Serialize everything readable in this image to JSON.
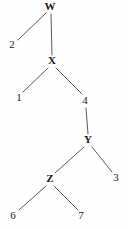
{
  "diagram": {
    "type": "tree",
    "title": "",
    "background_color": "#fefefe",
    "edge_color": "#5a5a5a",
    "text_color": "#1a1a1a",
    "width": 128,
    "height": 229,
    "nodes": [
      {
        "id": "W",
        "label": "W",
        "x": 50,
        "y": 7
      },
      {
        "id": "X",
        "label": "X",
        "x": 52,
        "y": 61
      },
      {
        "id": "Y",
        "label": "Y",
        "x": 88,
        "y": 140
      },
      {
        "id": "Z",
        "label": "Z",
        "x": 50,
        "y": 179
      }
    ],
    "leaves": [
      {
        "id": "L2",
        "label": "2",
        "x": 12,
        "y": 45
      },
      {
        "id": "L1",
        "label": "1",
        "x": 19,
        "y": 98
      },
      {
        "id": "L4",
        "label": "4",
        "x": 85,
        "y": 101
      },
      {
        "id": "L3",
        "label": "3",
        "x": 116,
        "y": 178
      },
      {
        "id": "L6",
        "label": "6",
        "x": 13,
        "y": 216
      },
      {
        "id": "L7",
        "label": "7",
        "x": 81,
        "y": 216
      }
    ],
    "edges": [
      {
        "from": "W",
        "to": "L2",
        "x1": 46,
        "y1": 13,
        "x2": 18,
        "y2": 40
      },
      {
        "from": "W",
        "to": "X",
        "x1": 51,
        "y1": 14,
        "x2": 52,
        "y2": 55
      },
      {
        "from": "X",
        "to": "L1",
        "x1": 48,
        "y1": 68,
        "x2": 23,
        "y2": 92
      },
      {
        "from": "X",
        "to": "L4",
        "x1": 56,
        "y1": 68,
        "x2": 82,
        "y2": 94
      },
      {
        "from": "L4",
        "to": "Y",
        "x1": 86,
        "y1": 108,
        "x2": 88,
        "y2": 134
      },
      {
        "from": "Y",
        "to": "Z",
        "x1": 84,
        "y1": 147,
        "x2": 55,
        "y2": 173
      },
      {
        "from": "Y",
        "to": "L3",
        "x1": 92,
        "y1": 147,
        "x2": 112,
        "y2": 172
      },
      {
        "from": "Z",
        "to": "L6",
        "x1": 46,
        "y1": 186,
        "x2": 19,
        "y2": 210
      },
      {
        "from": "Z",
        "to": "L7",
        "x1": 54,
        "y1": 186,
        "x2": 78,
        "y2": 210
      }
    ]
  }
}
